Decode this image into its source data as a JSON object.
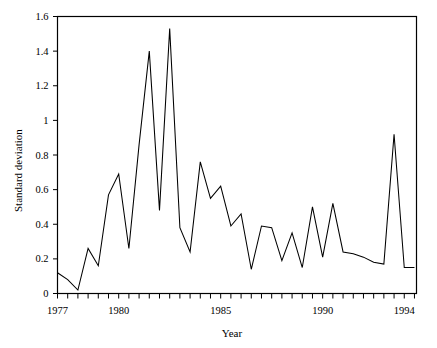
{
  "chart_data": {
    "type": "line",
    "title": "",
    "xlabel": "Year",
    "ylabel": "Standard deviation",
    "xlim": [
      1977,
      1994.6
    ],
    "ylim": [
      0,
      1.6
    ],
    "grid": false,
    "legend": null,
    "x_tick_labels": [
      "1977",
      "1980",
      "1985",
      "1990",
      "1994"
    ],
    "x_tick_label_values": [
      1977,
      1980,
      1985,
      1990,
      1994
    ],
    "x_minor_tick_interval": 0.5,
    "y_tick_labels": [
      "0",
      "0.2",
      "0.4",
      "0.6",
      "0.8",
      "1",
      "1.2",
      "1.4",
      "1.6"
    ],
    "y_tick_values": [
      0,
      0.2,
      0.4,
      0.6,
      0.8,
      1,
      1.2,
      1.4,
      1.6
    ],
    "series": [
      {
        "name": "Standard deviation",
        "color": "#000000",
        "x": [
          1977.0,
          1977.5,
          1978.0,
          1978.5,
          1979.0,
          1979.5,
          1980.0,
          1980.5,
          1981.0,
          1981.5,
          1982.0,
          1982.5,
          1983.0,
          1983.5,
          1984.0,
          1984.5,
          1985.0,
          1985.5,
          1986.0,
          1986.5,
          1987.0,
          1987.5,
          1988.0,
          1988.5,
          1989.0,
          1989.5,
          1990.0,
          1990.5,
          1991.0,
          1991.5,
          1992.0,
          1992.5,
          1993.0,
          1993.5,
          1994.0,
          1994.5
        ],
        "values": [
          0.12,
          0.08,
          0.02,
          0.26,
          0.16,
          0.57,
          0.69,
          0.26,
          0.86,
          1.4,
          0.48,
          1.53,
          0.38,
          0.24,
          0.76,
          0.55,
          0.62,
          0.39,
          0.46,
          0.14,
          0.39,
          0.38,
          0.19,
          0.35,
          0.15,
          0.5,
          0.21,
          0.52,
          0.24,
          0.23,
          0.21,
          0.18,
          0.17,
          0.92,
          0.15,
          0.15
        ]
      }
    ]
  },
  "axes": {
    "y_axis_title": "Standard deviation",
    "x_axis_title": "Year"
  }
}
